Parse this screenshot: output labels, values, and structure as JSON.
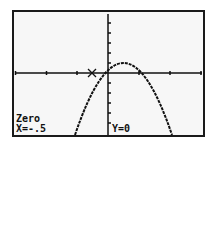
{
  "calculator_screen": {
    "mode_label": "Zero",
    "x_readout": "X=-.5",
    "y_readout": "Y=0"
  },
  "graph": {
    "function": "y = -k(x+0.5)(x-1.5)",
    "zeros": [
      -0.5,
      1.5
    ],
    "vertex_x": 0.5,
    "cursor_x": -0.5,
    "cursor_y": 0
  },
  "colors": {
    "background": "#f7f7f7",
    "ink": "#111111"
  }
}
